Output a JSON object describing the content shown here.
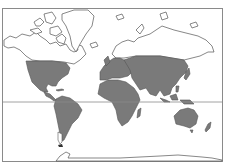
{
  "map": {
    "type": "world distribution map",
    "projection": "equirectangular-like",
    "colors": {
      "background": "#ffffff",
      "frame": "#8a8a8a",
      "outline": "#555555",
      "shaded": "#7a7a7a",
      "unshaded": "#ffffff",
      "equator": "#8a8a8a"
    },
    "features": {
      "frame": true,
      "equator_line": true,
      "shaded_regions": [
        "contiguous-usa-mexico-central-america",
        "south-america",
        "europe",
        "africa",
        "asia-temperate-tropical",
        "southeast-asia-islands",
        "australia",
        "new-zealand"
      ],
      "unshaded_regions": [
        "canada-arctic-archipelago",
        "alaska",
        "greenland",
        "northern-russia-siberia",
        "iceland",
        "antarctica",
        "southern-patagonia"
      ]
    }
  }
}
